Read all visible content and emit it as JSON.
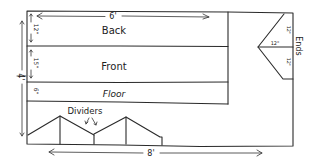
{
  "diagram": {
    "type": "hand-drawn layout sketch",
    "sections": [
      {
        "id": "back",
        "label": "Back",
        "height_label": "12\""
      },
      {
        "id": "front",
        "label": "Front",
        "height_label": "15\""
      },
      {
        "id": "floor",
        "label": "Floor",
        "height_label": "6\""
      }
    ],
    "dimensions": {
      "panel_width": "6'",
      "overall_height": "4'",
      "overall_width": "8'"
    },
    "ends": {
      "label": "Ends",
      "top_label": "12\"",
      "bottom_label": "12\"",
      "depth_label": "12\""
    },
    "dividers": {
      "label": "Dividers"
    },
    "colors": {
      "ink": "#2a2a2a",
      "paper": "#ffffff"
    }
  }
}
